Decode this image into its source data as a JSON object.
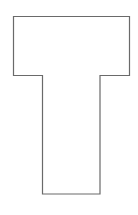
{
  "canvas": {
    "width": 138,
    "height": 215,
    "background": "#ffffff"
  },
  "shape": {
    "kind": "t-shape-outline",
    "stroke": "#6a6a6a",
    "stroke_width": 1.2,
    "fill": "#ffffff",
    "points": [
      [
        13.5,
        16.5
      ],
      [
        129.5,
        16.5
      ],
      [
        129.5,
        75.5
      ],
      [
        100,
        75.5
      ],
      [
        100,
        194
      ],
      [
        42.5,
        194
      ],
      [
        42.5,
        75.5
      ],
      [
        13.5,
        75.5
      ]
    ]
  }
}
